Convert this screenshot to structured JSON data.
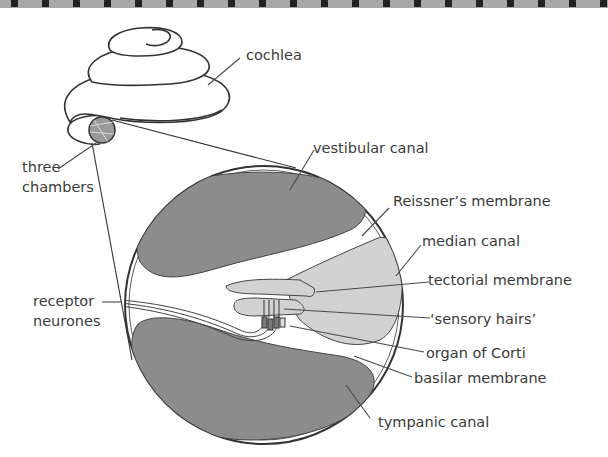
{
  "colors": {
    "background": "#ffffff",
    "dark_fill": "#8c8c8c",
    "light_fill": "#d2d2d2",
    "outline": "#333333",
    "label_text": "#3a3a3a",
    "top_border_dark": "#222222",
    "top_border_light": "#a8a8a8"
  },
  "diagram": {
    "labels": {
      "cochlea": "cochlea",
      "three_chambers_line1": "three",
      "three_chambers_line2": "chambers",
      "vestibular_canal": "vestibular canal",
      "reissners_membrane": "Reissner’s membrane",
      "median_canal": "median canal",
      "tectorial_membrane": "tectorial membrane",
      "receptor_neurones_line1": "receptor",
      "receptor_neurones_line2": "neurones",
      "sensory_hairs": "‘sensory hairs’",
      "organ_of_corti": "organ of Corti",
      "basilar_membrane": "basilar membrane",
      "tympanic_canal": "tympanic canal"
    },
    "parts": [
      "cochlea",
      "three chambers",
      "vestibular canal",
      "Reissner’s membrane",
      "median canal",
      "tectorial membrane",
      "receptor neurones",
      "‘sensory hairs’",
      "organ of Corti",
      "basilar membrane",
      "tympanic canal"
    ]
  }
}
